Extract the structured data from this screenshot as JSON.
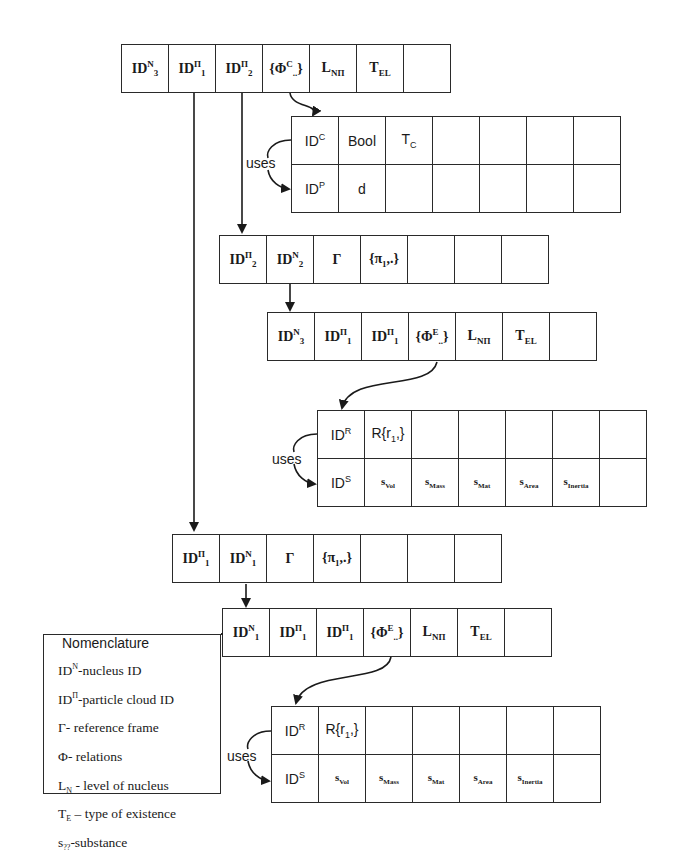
{
  "diagram": {
    "type": "nested record structure diagram",
    "tables": [
      {
        "id": "nucleus-record-top",
        "rows": [
          [
            "ID^N_3",
            "ID^Π_1",
            "ID^Π_2",
            "{Φ^C..}",
            "L_NΠ",
            "T_EL",
            ""
          ]
        ]
      },
      {
        "id": "condition-record-top",
        "rows": [
          [
            "ID^C",
            "Bool",
            "T_C",
            "",
            "",
            "",
            ""
          ],
          [
            "ID^P",
            "d",
            "",
            "",
            "",
            "",
            ""
          ]
        ]
      },
      {
        "id": "particle-cloud-record-2",
        "rows": [
          [
            "ID^Π_2",
            "ID^N_2",
            "Γ",
            "{π1,.}",
            "",
            "",
            ""
          ]
        ]
      },
      {
        "id": "nucleus-record-mid",
        "rows": [
          [
            "ID^N_3",
            "ID^Π_1",
            "ID^Π_1",
            "{Φ^E..}",
            "L_NΠ",
            "T_EL",
            ""
          ]
        ]
      },
      {
        "id": "relation-record-mid",
        "rows": [
          [
            "ID^R",
            "R{r1,}",
            "",
            "",
            "",
            "",
            ""
          ],
          [
            "ID^S",
            "s_Vol",
            "s_Mass",
            "s_Mat",
            "s_Area",
            "s_Inertia",
            ""
          ]
        ]
      },
      {
        "id": "particle-cloud-record-1",
        "rows": [
          [
            "ID^Π_1",
            "ID^N_1",
            "Γ",
            "{π1,.}",
            "",
            "",
            ""
          ]
        ]
      },
      {
        "id": "nucleus-record-bottom",
        "rows": [
          [
            "ID^N_1",
            "ID^Π_1",
            "ID^Π_1",
            "{Φ^E..}",
            "L_NΠ",
            "T_EL",
            ""
          ]
        ]
      },
      {
        "id": "relation-record-bottom",
        "rows": [
          [
            "ID^R",
            "R{r1,}",
            "",
            "",
            "",
            "",
            ""
          ],
          [
            "ID^S",
            "s_Vol",
            "s_Mass",
            "s_Mat",
            "s_Area",
            "s_Inertia",
            ""
          ]
        ]
      }
    ],
    "connector_labels": [
      "uses",
      "uses",
      "uses"
    ]
  },
  "t1": {
    "c1": {
      "b": "ID",
      "sup": "N",
      "sub": "3"
    },
    "c2": {
      "b": "ID",
      "sup": "Π",
      "sub": "1"
    },
    "c3": {
      "b": "ID",
      "sup": "Π",
      "sub": "2"
    },
    "c4": {
      "pre": "{Φ",
      "sup": "C",
      "sub": "..",
      "post": "}"
    },
    "c5": {
      "b": "L",
      "sub": "NΠ"
    },
    "c6": {
      "b": "T",
      "sub": "EL"
    }
  },
  "t2": {
    "r1c1": {
      "b": "ID",
      "sup": "C"
    },
    "r1c2": "Bool",
    "r1c3": {
      "b": "T",
      "sub": "C"
    },
    "r2c1": {
      "b": "ID",
      "sup": "P"
    },
    "r2c2": "d"
  },
  "t3": {
    "c1": {
      "b": "ID",
      "sup": "Π",
      "sub": "2"
    },
    "c2": {
      "b": "ID",
      "sup": "N",
      "sub": "2"
    },
    "c3": "Γ",
    "c4": {
      "pre": "{π",
      "sub": "1",
      "post": ",.}"
    }
  },
  "t4": {
    "c1": {
      "b": "ID",
      "sup": "N",
      "sub": "3"
    },
    "c2": {
      "b": "ID",
      "sup": "Π",
      "sub": "1"
    },
    "c3": {
      "b": "ID",
      "sup": "Π",
      "sub": "1"
    },
    "c4": {
      "pre": "{Φ",
      "sup": "E",
      "sub": "..",
      "post": "}"
    },
    "c5": {
      "b": "L",
      "sub": "NΠ"
    },
    "c6": {
      "b": "T",
      "sub": "EL"
    }
  },
  "t5": {
    "r1c1": {
      "b": "ID",
      "sup": "R"
    },
    "r1c2": {
      "pre": "R{r",
      "sub": "1",
      "post": ",}"
    },
    "r2c1": {
      "b": "ID",
      "sup": "S"
    },
    "r2c2": {
      "b": "s",
      "sub": "Vol"
    },
    "r2c3": {
      "b": "s",
      "sub": "Mass"
    },
    "r2c4": {
      "b": "s",
      "sub": "Mat"
    },
    "r2c5": {
      "b": "s",
      "sub": "Area"
    },
    "r2c6": {
      "b": "s",
      "sub": "Inertia"
    }
  },
  "t6": {
    "c1": {
      "b": "ID",
      "sup": "Π",
      "sub": "1"
    },
    "c2": {
      "b": "ID",
      "sup": "N",
      "sub": "1"
    },
    "c3": "Γ",
    "c4": {
      "pre": "{π",
      "sub": "1",
      "post": ",.}"
    }
  },
  "t7": {
    "c1": {
      "b": "ID",
      "sup": "N",
      "sub": "1"
    },
    "c2": {
      "b": "ID",
      "sup": "Π",
      "sub": "1"
    },
    "c3": {
      "b": "ID",
      "sup": "Π",
      "sub": "1"
    },
    "c4": {
      "pre": "{Φ",
      "sup": "E",
      "sub": "..",
      "post": "}"
    },
    "c5": {
      "b": "L",
      "sub": "NΠ"
    },
    "c6": {
      "b": "T",
      "sub": "EL"
    }
  },
  "t8": {
    "r1c1": {
      "b": "ID",
      "sup": "R"
    },
    "r1c2": {
      "pre": "R{r",
      "sub": "1",
      "post": ",}"
    },
    "r2c1": {
      "b": "ID",
      "sup": "S"
    },
    "r2c2": {
      "b": "s",
      "sub": "Vol"
    },
    "r2c3": {
      "b": "s",
      "sub": "Mass"
    },
    "r2c4": {
      "b": "s",
      "sub": "Mat"
    },
    "r2c5": {
      "b": "s",
      "sub": "Area"
    },
    "r2c6": {
      "b": "s",
      "sub": "Inertia"
    }
  },
  "uses_label": "uses",
  "nomenclature": {
    "title": "Nomenclature",
    "items": [
      {
        "sym": "ID",
        "sup": "N",
        "sub": "",
        "text": "-nucleus ID"
      },
      {
        "sym": "ID",
        "sup": "Π",
        "sub": "",
        "text": "-particle cloud ID"
      },
      {
        "sym": "Γ",
        "sup": "",
        "sub": "",
        "text": "- reference frame"
      },
      {
        "sym": "Φ",
        "sup": "",
        "sub": "",
        "text": "- relations"
      },
      {
        "sym": "L",
        "sup": "",
        "sub": "N",
        "text": " - level of nucleus"
      },
      {
        "sym": "T",
        "sup": "",
        "sub": "E",
        "text": " – type of existence"
      },
      {
        "sym": "s",
        "sup": "",
        "sub": "??",
        "text": "-substance"
      }
    ]
  },
  "colors": {
    "line": "#2a2a2a",
    "background": "#ffffff",
    "text": "#1a1a1a"
  }
}
